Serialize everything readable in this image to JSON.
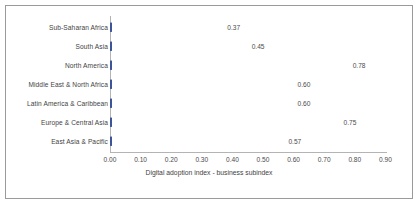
{
  "chart_data": {
    "type": "bar",
    "orientation": "horizontal",
    "title": "",
    "xlabel": "Digital adoption index - business subindex",
    "ylabel": "",
    "xlim": [
      0.0,
      0.9
    ],
    "xticks": [
      "0.00",
      "0.10",
      "0.20",
      "0.30",
      "0.40",
      "0.50",
      "0.60",
      "0.70",
      "0.80",
      "0.90"
    ],
    "grid": false,
    "legend": false,
    "bar_color": "#4a63a8",
    "categories": [
      "Sub-Saharan Africa",
      "South Asia",
      "North America",
      "Middle East & North Africa",
      "Latin America & Caribbean",
      "Europe & Central Asia",
      "East Asia & Pacific"
    ],
    "values": [
      0.37,
      0.45,
      0.78,
      0.6,
      0.6,
      0.75,
      0.57
    ],
    "value_labels": [
      "0.37",
      "0.45",
      "0.78",
      "0.60",
      "0.60",
      "0.75",
      "0.57"
    ]
  }
}
